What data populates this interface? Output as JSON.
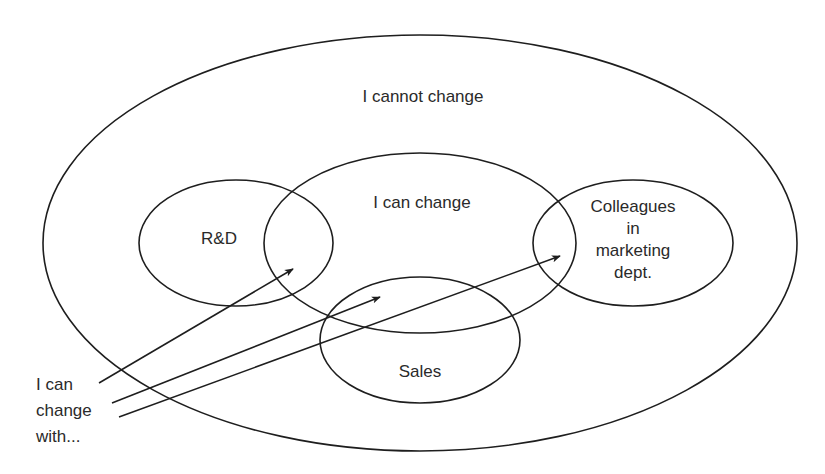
{
  "diagram": {
    "type": "nested-venn",
    "regions": {
      "outer": {
        "label": "I cannot change"
      },
      "center": {
        "label": "I can change"
      },
      "left": {
        "label": "R&D"
      },
      "right": {
        "lines": [
          "Colleagues",
          "in",
          "marketing",
          "dept."
        ]
      },
      "bottom": {
        "label": "Sales"
      }
    },
    "caption": {
      "lines": [
        "I can",
        "change",
        "with..."
      ]
    },
    "arrows": [
      {
        "from": "caption",
        "to": "R&D ∩ I can change"
      },
      {
        "from": "caption",
        "to": "Sales ∩ I can change"
      },
      {
        "from": "caption",
        "to": "Colleagues in marketing dept. ∩ I can change"
      }
    ],
    "colors": {
      "stroke": "#1e1e1e",
      "text": "#2a2a2a",
      "background": "#ffffff"
    }
  }
}
